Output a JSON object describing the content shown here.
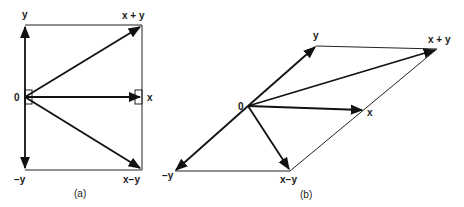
{
  "figure_a": {
    "caption": "(a)",
    "labels": {
      "origin": "0",
      "y": "y",
      "neg_y": "−y",
      "x": "x",
      "x_plus_y": "x + y",
      "x_minus_y": "x−y"
    }
  },
  "figure_b": {
    "caption": "(b)",
    "labels": {
      "origin": "0",
      "y": "y",
      "neg_y": "−y",
      "x": "x",
      "x_plus_y": "x + y",
      "x_minus_y": "x−y"
    }
  }
}
